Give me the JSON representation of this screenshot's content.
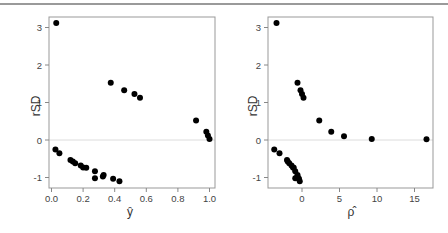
{
  "chart_data": [
    {
      "type": "scatter",
      "title": "",
      "xlabel": "ŷ",
      "ylabel": "rSD",
      "xlim": [
        0.0,
        1.0
      ],
      "ylim": [
        -1.2,
        3.2
      ],
      "xticks": [
        "0.0",
        "0.2",
        "0.4",
        "0.6",
        "0.8",
        "1.0"
      ],
      "yticks": [
        "-1",
        "0",
        "1",
        "2",
        "3"
      ],
      "reference_line": {
        "y": 0,
        "color": "#dcdcdc"
      },
      "grid": false,
      "points": [
        [
          0.03,
          3.12
        ],
        [
          0.375,
          1.53
        ],
        [
          0.46,
          1.33
        ],
        [
          0.525,
          1.23
        ],
        [
          0.56,
          1.13
        ],
        [
          0.915,
          0.52
        ],
        [
          0.98,
          0.22
        ],
        [
          0.99,
          0.12
        ],
        [
          1.0,
          0.03
        ],
        [
          0.025,
          -0.25
        ],
        [
          0.05,
          -0.35
        ],
        [
          0.12,
          -0.53
        ],
        [
          0.135,
          -0.57
        ],
        [
          0.15,
          -0.62
        ],
        [
          0.185,
          -0.68
        ],
        [
          0.2,
          -0.73
        ],
        [
          0.22,
          -0.74
        ],
        [
          0.275,
          -0.83
        ],
        [
          0.275,
          -1.02
        ],
        [
          0.325,
          -0.97
        ],
        [
          0.33,
          -0.93
        ],
        [
          0.39,
          -1.03
        ],
        [
          0.43,
          -1.1
        ]
      ]
    },
    {
      "type": "scatter",
      "title": "",
      "xlabel": "ρ̂",
      "ylabel": "rSD",
      "xlim": [
        -4,
        17
      ],
      "ylim": [
        -1.2,
        3.2
      ],
      "xticks": [
        "0",
        "5",
        "10",
        "15"
      ],
      "yticks": [
        "-1",
        "0",
        "1",
        "2",
        "3"
      ],
      "reference_line": {
        "y": 0,
        "color": "#dcdcdc"
      },
      "grid": false,
      "points": [
        [
          -3.4,
          3.12
        ],
        [
          -0.6,
          1.53
        ],
        [
          -0.2,
          1.33
        ],
        [
          0.0,
          1.23
        ],
        [
          0.2,
          1.13
        ],
        [
          2.3,
          0.52
        ],
        [
          3.9,
          0.22
        ],
        [
          5.6,
          0.1
        ],
        [
          9.3,
          0.03
        ],
        [
          16.6,
          0.02
        ],
        [
          -3.7,
          -0.25
        ],
        [
          -3.0,
          -0.35
        ],
        [
          -2.0,
          -0.53
        ],
        [
          -1.9,
          -0.57
        ],
        [
          -1.7,
          -0.62
        ],
        [
          -1.4,
          -0.68
        ],
        [
          -1.2,
          -0.73
        ],
        [
          -1.1,
          -0.74
        ],
        [
          -0.9,
          -0.83
        ],
        [
          -0.9,
          -1.02
        ],
        [
          -0.6,
          -0.97
        ],
        [
          -0.6,
          -0.93
        ],
        [
          -0.4,
          -1.03
        ],
        [
          -0.3,
          -1.1
        ]
      ]
    }
  ],
  "panels": {
    "left": {
      "xlabel": "ŷ",
      "ylabel": "rSD"
    },
    "right": {
      "xlabel": "ρ̂",
      "ylabel": "rSD"
    }
  },
  "colors": {
    "points": "#000000",
    "frame": "#999999",
    "zero_line": "#dcdcdc",
    "top_rule": "#9a9a9a"
  }
}
